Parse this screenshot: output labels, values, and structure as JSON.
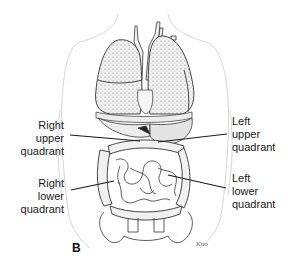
{
  "figure": {
    "panel_letter": "B",
    "labels": {
      "right_upper": [
        "Right",
        "upper",
        "quadrant"
      ],
      "right_lower": [
        "Right",
        "lower",
        "quadrant"
      ],
      "left_upper": [
        "Left",
        "upper",
        "quadrant"
      ],
      "left_lower": [
        "Left",
        "lower",
        "quadrant"
      ]
    },
    "colors": {
      "line": "#1a1a1a",
      "body_outline": "#d8d8d8",
      "organ_fill": "#e9e9e9",
      "organ_stroke": "#444444"
    }
  }
}
